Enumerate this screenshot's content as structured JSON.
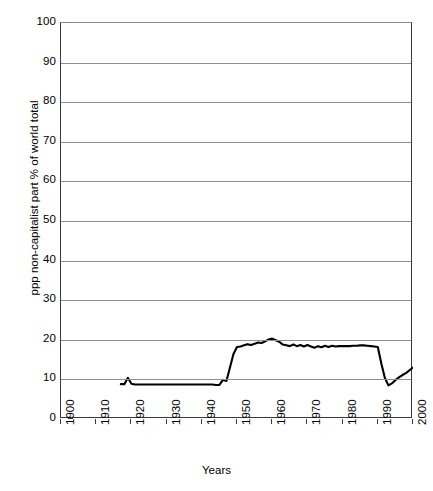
{
  "chart_data": {
    "type": "line",
    "title": "",
    "xlabel": "Years",
    "ylabel": "ppp non-capitalist part  % of world total",
    "xlim": [
      1900,
      2000
    ],
    "ylim": [
      0,
      100
    ],
    "grid": true,
    "legend": "none",
    "yticks": [
      0,
      10,
      20,
      30,
      40,
      50,
      60,
      70,
      80,
      90,
      100
    ],
    "ytick_labels": [
      "0",
      "10",
      "20",
      "30",
      "40",
      "50",
      "60",
      "70",
      "80",
      "90",
      "100"
    ],
    "xticks": [
      1900,
      1910,
      1920,
      1930,
      1940,
      1950,
      1960,
      1970,
      1980,
      1990,
      2000
    ],
    "xtick_labels": [
      "1900",
      "1910",
      "1920",
      "1930",
      "1940",
      "1950",
      "1960",
      "1970",
      "1980",
      "1990",
      "2000"
    ],
    "line_color": "#000000",
    "line_width": 2.1,
    "series": [
      {
        "name": "ppp non-capitalist part % of world total",
        "x": [
          1917,
          1918,
          1919,
          1920,
          1921,
          1925,
          1930,
          1935,
          1940,
          1943,
          1944,
          1945,
          1946,
          1947,
          1948,
          1949,
          1950,
          1951,
          1952,
          1953,
          1954,
          1955,
          1956,
          1957,
          1958,
          1959,
          1960,
          1961,
          1962,
          1963,
          1964,
          1965,
          1966,
          1967,
          1968,
          1969,
          1970,
          1971,
          1972,
          1973,
          1974,
          1975,
          1976,
          1977,
          1978,
          1979,
          1980,
          1981,
          1982,
          1983,
          1984,
          1985,
          1986,
          1987,
          1988,
          1989,
          1990,
          1991,
          1992,
          1993,
          1994,
          1995,
          1996,
          1997,
          1998,
          1999,
          2000
        ],
        "y": [
          8.8,
          8.8,
          10.4,
          8.9,
          8.7,
          8.7,
          8.7,
          8.7,
          8.7,
          8.7,
          8.6,
          8.6,
          9.9,
          9.6,
          13.0,
          16.4,
          18.2,
          18.3,
          18.6,
          18.9,
          18.7,
          19.0,
          19.3,
          19.2,
          19.6,
          20.1,
          20.3,
          19.9,
          19.5,
          18.8,
          18.6,
          18.4,
          18.8,
          18.4,
          18.7,
          18.3,
          18.7,
          18.3,
          18.0,
          18.4,
          18.1,
          18.5,
          18.2,
          18.5,
          18.3,
          18.4,
          18.4,
          18.4,
          18.4,
          18.5,
          18.5,
          18.6,
          18.6,
          18.5,
          18.4,
          18.3,
          18.2,
          14.0,
          10.4,
          8.5,
          9.0,
          9.8,
          10.5,
          11.1,
          11.6,
          12.3,
          13.0
        ]
      }
    ]
  }
}
